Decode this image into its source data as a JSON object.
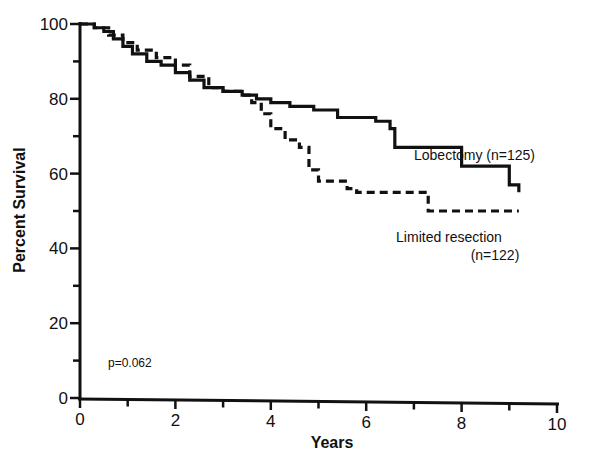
{
  "chart_data": {
    "type": "line",
    "subtype": "kaplan-meier step",
    "title": "",
    "xlabel": "Years",
    "ylabel": "Percent Survival",
    "xlim": [
      0,
      10
    ],
    "ylim": [
      0,
      100
    ],
    "xticks": [
      0,
      2,
      4,
      6,
      8,
      10
    ],
    "xminor_ticks": [
      1,
      3,
      5,
      7,
      9
    ],
    "yticks": [
      0,
      20,
      40,
      60,
      80,
      100
    ],
    "yminor_ticks": [
      10,
      30,
      50,
      70,
      90
    ],
    "grid": false,
    "legend": "inline labels near curve ends",
    "annotations": [
      "p=0.062"
    ],
    "series": [
      {
        "name": "Lobectomy (n=125)",
        "style": "solid",
        "color": "#111111",
        "points": [
          [
            0,
            100
          ],
          [
            0.3,
            99
          ],
          [
            0.5,
            98
          ],
          [
            0.7,
            96
          ],
          [
            0.9,
            94
          ],
          [
            1.1,
            92
          ],
          [
            1.4,
            90
          ],
          [
            1.7,
            89
          ],
          [
            2.0,
            87
          ],
          [
            2.3,
            85
          ],
          [
            2.6,
            83
          ],
          [
            3.0,
            82
          ],
          [
            3.4,
            81
          ],
          [
            3.7,
            80
          ],
          [
            4.0,
            79
          ],
          [
            4.4,
            78
          ],
          [
            4.9,
            77
          ],
          [
            5.4,
            75
          ],
          [
            6.2,
            74
          ],
          [
            6.5,
            72
          ],
          [
            6.6,
            67
          ],
          [
            8.0,
            62
          ],
          [
            9.0,
            57
          ],
          [
            9.2,
            55
          ]
        ]
      },
      {
        "name": "Limited resection (n=122)",
        "style": "dashed",
        "color": "#111111",
        "points": [
          [
            0,
            100
          ],
          [
            0.3,
            99
          ],
          [
            0.6,
            97
          ],
          [
            0.9,
            95
          ],
          [
            1.2,
            93
          ],
          [
            1.6,
            91
          ],
          [
            2.0,
            89
          ],
          [
            2.3,
            86
          ],
          [
            2.7,
            83
          ],
          [
            3.0,
            82
          ],
          [
            3.4,
            81
          ],
          [
            3.6,
            79
          ],
          [
            3.8,
            76
          ],
          [
            4.0,
            72
          ],
          [
            4.3,
            69
          ],
          [
            4.6,
            67
          ],
          [
            4.8,
            61
          ],
          [
            5.0,
            58
          ],
          [
            5.6,
            56
          ],
          [
            5.8,
            55
          ],
          [
            7.3,
            50
          ],
          [
            9.2,
            50
          ]
        ]
      }
    ]
  },
  "labels": {
    "xlabel": "Years",
    "ylabel": "Percent Survival",
    "lobectomy": "Lobectomy (n=125)",
    "limited_line1": "Limited resection",
    "limited_line2": "(n=122)",
    "pvalue": "p=0.062",
    "xticks": [
      "0",
      "2",
      "4",
      "6",
      "8",
      "10"
    ],
    "yticks": [
      "0",
      "20",
      "40",
      "60",
      "80",
      "100"
    ]
  }
}
